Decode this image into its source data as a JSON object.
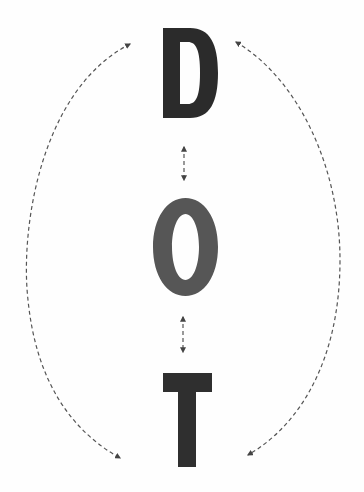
{
  "diagram": {
    "letters": [
      {
        "char": "D",
        "color": "#2b2b2b"
      },
      {
        "char": "O",
        "color": "#555555"
      },
      {
        "char": "T",
        "color": "#2f2f2f"
      }
    ],
    "arrow_color": "#555555",
    "connectors": [
      {
        "id": "left-arc",
        "from": "D",
        "to": "T",
        "style": "dashed",
        "direction": "bidirectional"
      },
      {
        "id": "right-arc",
        "from": "D",
        "to": "T",
        "style": "dashed",
        "direction": "bidirectional"
      },
      {
        "id": "d-o-arrow",
        "from": "D",
        "to": "O",
        "style": "dashed",
        "direction": "bidirectional"
      },
      {
        "id": "o-t-arrow",
        "from": "O",
        "to": "T",
        "style": "dashed",
        "direction": "bidirectional"
      }
    ]
  }
}
